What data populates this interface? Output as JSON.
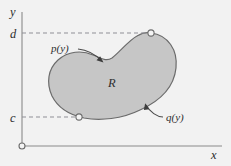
{
  "figure": {
    "type": "math-diagram",
    "background_color": "#f2f2f2",
    "region_fill_color": "#c6c6c6",
    "region_stroke_color": "#6b6b6b",
    "axis_color": "#8a8a8a",
    "dash_color": "#8f8f96",
    "axes": {
      "y_axis_label": "y",
      "x_axis_label": "x",
      "origin_marker": "open-circle"
    },
    "ticks": {
      "y_upper_label": "d",
      "y_lower_label": "c"
    },
    "labels": {
      "region": "R",
      "left_curve": "p(y)",
      "right_curve": "q(y)"
    },
    "markers": [
      {
        "name": "upper-tangent-point",
        "at_label": "d"
      },
      {
        "name": "lower-tangent-point",
        "at_label": "c"
      }
    ]
  }
}
